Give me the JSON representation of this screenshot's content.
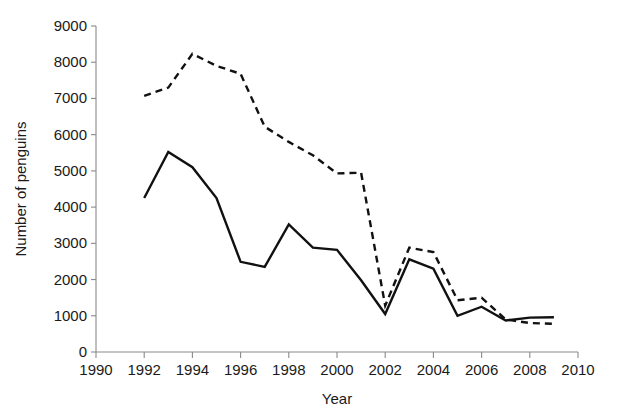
{
  "chart_data": {
    "type": "line",
    "title": "",
    "xlabel": "Year",
    "ylabel": "Number of penguins",
    "xlim": [
      1990,
      2010
    ],
    "ylim": [
      0,
      9000
    ],
    "xticks": [
      1990,
      1992,
      1994,
      1996,
      1998,
      2000,
      2002,
      2004,
      2006,
      2008,
      2010
    ],
    "yticks": [
      0,
      1000,
      2000,
      3000,
      4000,
      5000,
      6000,
      7000,
      8000,
      9000
    ],
    "xtick_labels": [
      "1990",
      "1992",
      "1994",
      "1996",
      "1998",
      "2000",
      "2002",
      "2004",
      "2006",
      "2008",
      "2010"
    ],
    "ytick_labels": [
      "0",
      "1000",
      "2000",
      "3000",
      "4000",
      "5000",
      "6000",
      "7000",
      "8000",
      "9000"
    ],
    "grid": false,
    "legend": "none",
    "x": [
      1992,
      1993,
      1994,
      1995,
      1996,
      1997,
      1998,
      1999,
      2000,
      2001,
      2002,
      2003,
      2004,
      2005,
      2006,
      2007,
      2008,
      2009
    ],
    "series": [
      {
        "name": "solid-series",
        "style": "solid",
        "color": "#111111",
        "values": [
          4250,
          5520,
          5100,
          4250,
          2490,
          2350,
          3520,
          2880,
          2820,
          1980,
          1050,
          2560,
          2300,
          1000,
          1250,
          870,
          950,
          960
        ]
      },
      {
        "name": "dashed-series",
        "style": "dashed",
        "color": "#111111",
        "values": [
          7070,
          7300,
          8230,
          7900,
          7680,
          6220,
          5800,
          5430,
          4930,
          4950,
          1280,
          2880,
          2760,
          1430,
          1500,
          900,
          800,
          780
        ]
      }
    ]
  },
  "axis": {
    "x_title": "Year",
    "y_title": "Number of penguins"
  }
}
